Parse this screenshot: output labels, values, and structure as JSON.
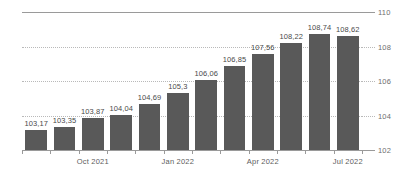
{
  "chart_data": {
    "type": "bar",
    "title": "",
    "subtitle": "",
    "xlabel": "",
    "ylabel": "",
    "ylim": [
      102,
      110
    ],
    "yticks": [
      "102",
      "104",
      "106",
      "108",
      "110"
    ],
    "ytick_values": [
      102,
      104,
      106,
      108,
      110
    ],
    "grid": true,
    "grid_axis": "y",
    "legend": false,
    "legend_position": "none",
    "decimal_separator": ",",
    "bar_color": "#595959",
    "categories": [
      "Aug 2021",
      "Sep 2021",
      "Oct 2021",
      "Nov 2021",
      "Dec 2021",
      "Jan 2022",
      "Feb 2022",
      "Mar 2022",
      "Apr 2022",
      "May 2022",
      "Jun 2022",
      "Jul 2022"
    ],
    "values": [
      103.17,
      103.35,
      103.87,
      104.04,
      104.69,
      105.3,
      106.06,
      106.85,
      107.56,
      108.22,
      108.74,
      108.62
    ],
    "data_labels": [
      "103,17",
      "103,35",
      "103,87",
      "104,04",
      "104,69",
      "105,3",
      "106,06",
      "106,85",
      "107,56",
      "108,22",
      "108,74",
      "108,62"
    ],
    "xtick_labels": [
      {
        "label": "Oct 2021",
        "category_index": 2
      },
      {
        "label": "Jan 2022",
        "category_index": 5
      },
      {
        "label": "Apr 2022",
        "category_index": 8
      },
      {
        "label": "Jul 2022",
        "category_index": 11
      }
    ]
  }
}
